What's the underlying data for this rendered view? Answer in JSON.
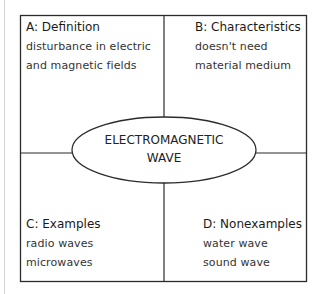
{
  "diagram": {
    "type": "frayer-model",
    "center": {
      "line1": "ELECTROMAGNETIC",
      "line2": "WAVE"
    },
    "quadrants": [
      {
        "id": "A",
        "title": "A: Definition",
        "items": [
          "disturbance in electric",
          "and magnetic fields"
        ]
      },
      {
        "id": "B",
        "title": "B: Characteristics",
        "items": [
          "doesn't need",
          "material medium"
        ]
      },
      {
        "id": "C",
        "title": "C: Examples",
        "items": [
          "radio waves",
          "microwaves"
        ]
      },
      {
        "id": "D",
        "title": "D: Nonexamples",
        "items": [
          "water wave",
          "sound wave"
        ]
      }
    ],
    "colors": {
      "line": "#2b2b2b",
      "background": "#ffffff"
    }
  }
}
